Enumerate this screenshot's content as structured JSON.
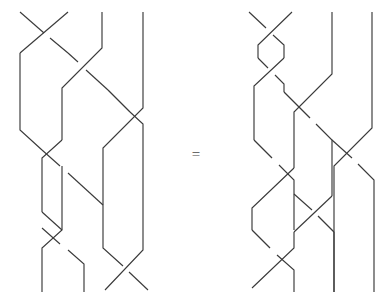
{
  "figure": {
    "type": "braid-equation",
    "background_color": "#ffffff",
    "stroke_color": "#3a3a3a",
    "equals_label": "=",
    "strand_count": 4,
    "left_braid": {
      "name": "left-braid-word",
      "label": "",
      "crossings": [
        {
          "position": 1,
          "height": 0,
          "over": "right-over-left"
        },
        {
          "position": 2,
          "height": 1,
          "over": "left-over-right"
        },
        {
          "position": 3,
          "height": 2,
          "over": "left-over-right"
        },
        {
          "position": 1,
          "height": 3,
          "over": "right-over-left"
        },
        {
          "position": 2,
          "height": 4,
          "over": "right-over-left"
        },
        {
          "position": 1,
          "height": 5,
          "over": "left-over-right"
        },
        {
          "position": 3,
          "height": 6,
          "over": "right-over-left"
        }
      ]
    },
    "right_braid": {
      "name": "right-braid-word",
      "label": "",
      "crossings": [
        {
          "position": 1,
          "height": 0,
          "over": "right-over-left"
        },
        {
          "position": 1,
          "height": 1,
          "over": "left-over-right"
        },
        {
          "position": 2,
          "height": 2,
          "over": "left-over-right"
        },
        {
          "position": 3,
          "height": 3,
          "over": "right-over-left"
        },
        {
          "position": 2,
          "height": 4,
          "over": "left-over-right"
        },
        {
          "position": 1,
          "height": 5,
          "over": "right-over-left"
        }
      ]
    },
    "paths": {
      "left": [
        "M 18 10 L 44 38 L 44 38",
        "M 68 10 L 24 57 L 24 98 L 48 124 L 48 165 L 24 190 L 24 231 L 48 257 L 48 292",
        "M 18 10 L 62 57 L 62 98 L 38 124 L 38 165 L 62 190 L 62 231 L 38 257 L 38 292",
        "M 102 10 L 102 45 L 62 90 L 62 131",
        "M 143 10 L 143 113 L 102 158 L 102 199 L 143 244 L 143 292",
        "M 102 10 L 102 45 L 143 90 L 143 113",
        "M 24 98 L 48 124",
        "M 48 165 L 24 190"
      ],
      "right": [
        "M 250 10 L 276 38",
        "M 296 10 L 258 48 L 258 62 L 284 88",
        "M 250 10 L 284 45 L 284 62 L 258 88 L 258 129",
        "M 256 88 L 282 114",
        "M 336 10 L 336 76 L 296 121 L 296 162",
        "M 376 10 L 376 131 L 336 176 L 336 292",
        "M 296 162 L 336 205"
      ]
    }
  }
}
